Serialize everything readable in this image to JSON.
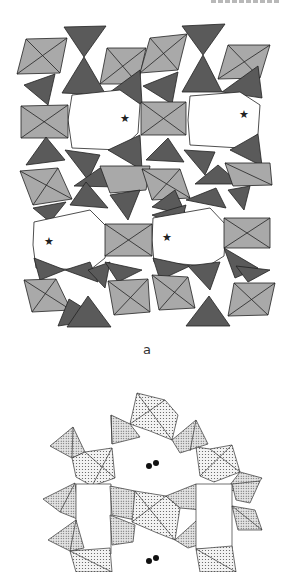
{
  "figure": {
    "panels": [
      {
        "id": "a",
        "label": "a",
        "description": "Polyhedral framework projection with octahedra (light grey) and tetrahedra (dark grey); stars mark channel centres",
        "colors": {
          "octahedron": "#a9a9a9",
          "tetrahedron": "#5a5a5a",
          "edge": "#222222",
          "background": "#ffffff"
        },
        "star_markers": [
          {
            "x": 125,
            "y": 118
          },
          {
            "x": 244,
            "y": 114
          },
          {
            "x": 49,
            "y": 241
          },
          {
            "x": 167,
            "y": 237
          }
        ]
      },
      {
        "id": "b",
        "label": "",
        "description": "Ring of stippled polyhedra with dumbbell-shaped guest species in cavities",
        "colors": {
          "stipple": "#cfcfcf",
          "edge": "#333333"
        },
        "dumbbell_markers": [
          {
            "x": 153,
            "y": 465
          },
          {
            "x": 153,
            "y": 560
          }
        ]
      }
    ],
    "header_fragment": "(cropped running header)"
  }
}
